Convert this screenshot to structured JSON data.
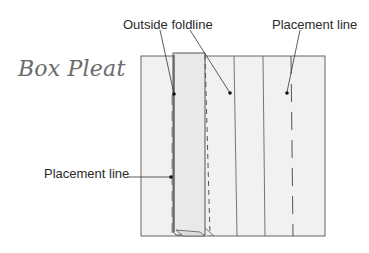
{
  "title": "Box Pleat",
  "labels": {
    "outside_foldline": "Outside foldline",
    "placement_line_top": "Placement line",
    "placement_line_left": "Placement line",
    "center": "Center"
  },
  "colors": {
    "fabric": "#f1f1f1",
    "fold": "#e6e6e6",
    "stroke": "#555555",
    "text": "#2a2a2a",
    "title": "#6b6b6b"
  }
}
